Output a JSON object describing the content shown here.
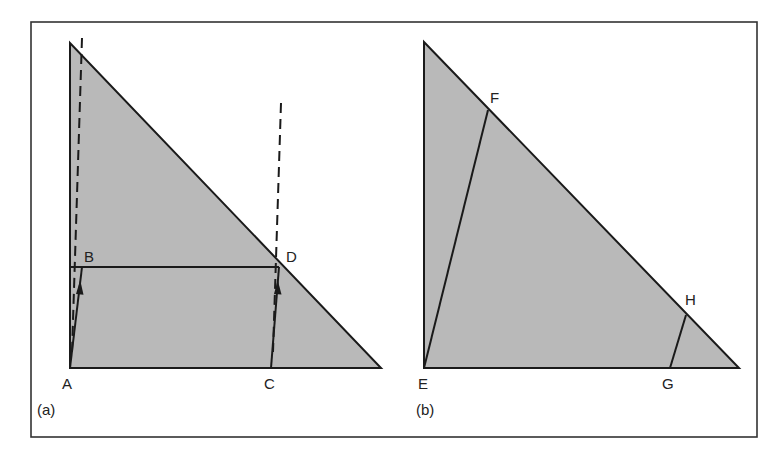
{
  "figure": {
    "frame": {
      "x": 31,
      "y": 22,
      "width": 726,
      "height": 415,
      "stroke": "#333333"
    },
    "fill_color": "#b9b9b9",
    "line_color": "#1a1a1a",
    "panels": [
      {
        "id": "a",
        "caption": "(a)",
        "triangle": [
          [
            70,
            43
          ],
          [
            70,
            368
          ],
          [
            381,
            368
          ]
        ],
        "points": {
          "A": {
            "label": "A",
            "x": 70,
            "y": 368
          },
          "B": {
            "label": "B",
            "x": 82,
            "y": 267
          },
          "C": {
            "label": "C",
            "x": 271,
            "y": 368
          },
          "D": {
            "label": "D",
            "x": 279,
            "y": 267
          }
        },
        "horizontal_line": {
          "from": "B",
          "to": "D",
          "y": 267,
          "x1": 70,
          "x2": 279
        },
        "arrows": [
          {
            "from": "A",
            "to": "B"
          },
          {
            "from": "C",
            "to": "D"
          }
        ],
        "dashed_lines": [
          {
            "x1": 82,
            "y1": 38,
            "x2": 72,
            "y2": 350
          },
          {
            "x1": 281,
            "y1": 103,
            "x2": 273,
            "y2": 350
          }
        ]
      },
      {
        "id": "b",
        "caption": "(b)",
        "triangle": [
          [
            424,
            42
          ],
          [
            424,
            368
          ],
          [
            739,
            368
          ]
        ],
        "points": {
          "E": {
            "label": "E",
            "x": 424,
            "y": 368
          },
          "F": {
            "label": "F",
            "x": 488,
            "y": 110
          },
          "G": {
            "label": "G",
            "x": 670,
            "y": 368
          },
          "H": {
            "label": "H",
            "x": 686,
            "y": 315
          }
        },
        "segments": [
          {
            "from": "E",
            "to": "F"
          },
          {
            "from": "G",
            "to": "H"
          }
        ]
      }
    ]
  },
  "labels": {
    "A": "A",
    "B": "B",
    "C": "C",
    "D": "D",
    "E": "E",
    "F": "F",
    "G": "G",
    "H": "H",
    "caption_a": "(a)",
    "caption_b": "(b)"
  }
}
